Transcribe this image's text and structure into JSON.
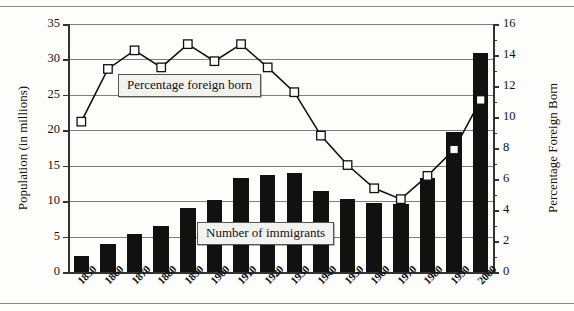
{
  "figure": {
    "background_color": "#fdfdfb",
    "bar_color": "#111111",
    "line_color": "#111111",
    "marker_fill": "#ffffff",
    "grid_color": "#7d7d7a"
  },
  "axes": {
    "left": {
      "title": "Population (in millions)",
      "ticks": [
        "0",
        "5",
        "10",
        "15",
        "20",
        "25",
        "30",
        "35"
      ],
      "min": 0,
      "max": 35
    },
    "right": {
      "title": "Percentage Foreign Born",
      "ticks": [
        "0",
        "2",
        "4",
        "6",
        "8",
        "10",
        "12",
        "14",
        "16"
      ],
      "min": 0,
      "max": 16
    },
    "x": {
      "ticks": [
        "1850",
        "1860",
        "1870",
        "1880",
        "1890",
        "1900",
        "1910",
        "1920",
        "1930",
        "1940",
        "1950",
        "1960",
        "1970",
        "1980",
        "1990",
        "2000"
      ]
    }
  },
  "legend": {
    "line_label": "Percentage foreign born",
    "bar_label": "Number of immigrants"
  },
  "chart_data": {
    "type": "bar",
    "title": "",
    "xlabel": "",
    "ylabel": "Population (in millions)",
    "y2label": "Percentage Foreign Born",
    "ylim": [
      0,
      35
    ],
    "y2lim": [
      0,
      16
    ],
    "grid": true,
    "legend_position": "inside",
    "categories": [
      "1850",
      "1860",
      "1870",
      "1880",
      "1890",
      "1900",
      "1910",
      "1920",
      "1930",
      "1940",
      "1950",
      "1960",
      "1970",
      "1980",
      "1990",
      "2000"
    ],
    "series": [
      {
        "name": "Number of immigrants",
        "type": "bar",
        "axis": "left",
        "unit": "millions",
        "values": [
          2.2,
          4.0,
          5.4,
          6.5,
          9.1,
          10.2,
          13.3,
          13.7,
          14.0,
          11.4,
          10.3,
          9.7,
          9.6,
          13.3,
          19.7,
          30.9
        ]
      },
      {
        "name": "Percentage foreign born",
        "type": "line",
        "axis": "right",
        "unit": "percent",
        "values": [
          9.7,
          13.1,
          14.3,
          13.2,
          14.7,
          13.6,
          14.7,
          13.2,
          11.6,
          8.8,
          6.9,
          5.4,
          4.7,
          6.2,
          7.9,
          11.1
        ]
      }
    ]
  }
}
